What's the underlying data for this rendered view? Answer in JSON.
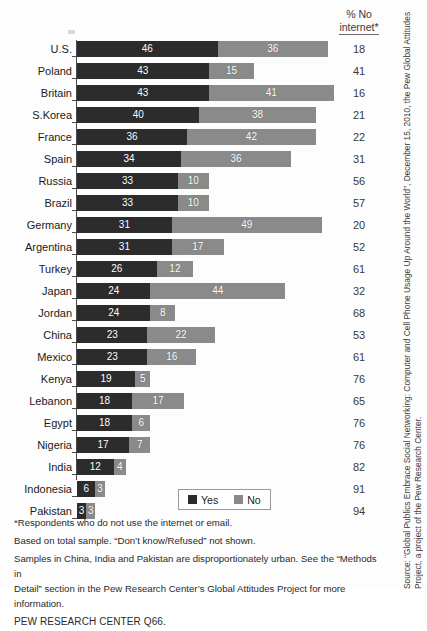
{
  "header": {
    "col_line1": "% No",
    "col_line2": "internet*"
  },
  "legend": {
    "yes_label": "Yes",
    "no_label": "No"
  },
  "footnotes": {
    "line1": "*Respondents who do not use the internet or email.",
    "line2": "Based on total sample. “Don’t know/Refused” not shown.",
    "line3": "Samples in China, India and Pakistan are disproportionately urban. See the “Methods in",
    "line4": "Detail” section in the Pew Research Center’s Global Attitudes Project for more information.",
    "line5": "PEW RESEARCH CENTER Q66."
  },
  "source": {
    "text": "Source: “Global Publics Embrace Social Networking: Computer and Cell Phone Usage Up Around the World”, December 15, 2010, the Pew Global Attitudes Project, a project of the Pew Research Center."
  },
  "colors": {
    "yes": "#2c2c2c",
    "no": "#8a8a8a",
    "text": "#1a1a1a",
    "background": "#fdfdfd"
  },
  "chart_data": {
    "type": "bar",
    "orientation": "horizontal",
    "stacked": true,
    "title": "",
    "xlabel": "",
    "ylabel": "",
    "xlim": [
      0,
      84
    ],
    "grid": false,
    "legend_position": "bottom-center",
    "categories": [
      "U.S.",
      "Poland",
      "Britain",
      "S.Korea",
      "France",
      "Spain",
      "Russia",
      "Brazil",
      "Germany",
      "Argentina",
      "Turkey",
      "Japan",
      "Jordan",
      "China",
      "Mexico",
      "Kenya",
      "Lebanon",
      "Egypt",
      "Nigeria",
      "India",
      "Indonesia",
      "Pakistan"
    ],
    "series": [
      {
        "name": "Yes",
        "values": [
          46,
          43,
          43,
          40,
          36,
          34,
          33,
          33,
          31,
          31,
          26,
          24,
          24,
          23,
          23,
          19,
          18,
          18,
          17,
          12,
          6,
          3
        ]
      },
      {
        "name": "No",
        "values": [
          36,
          15,
          41,
          38,
          42,
          36,
          10,
          10,
          49,
          17,
          12,
          44,
          8,
          22,
          16,
          5,
          17,
          6,
          7,
          4,
          3,
          3
        ]
      }
    ],
    "annotation_column": {
      "header": "% No internet*",
      "values": [
        18,
        41,
        16,
        21,
        22,
        31,
        56,
        57,
        20,
        52,
        61,
        32,
        68,
        53,
        61,
        76,
        65,
        76,
        76,
        82,
        91,
        94
      ]
    },
    "px_per_unit": 3.06
  }
}
